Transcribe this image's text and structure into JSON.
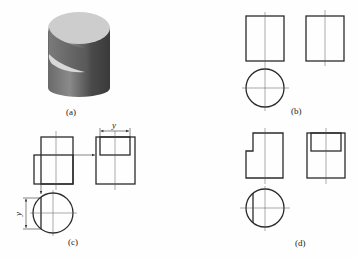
{
  "figure": {
    "panels": [
      {
        "id": "a",
        "label": "(a)",
        "description": "Isometric view of cylinder with a cutout notch"
      },
      {
        "id": "b",
        "label": "(b)",
        "description": "Three views of full cylinder: front, side, top"
      },
      {
        "id": "c",
        "label": "(c)",
        "description": "Construction of views with projection arrows and y dimension"
      },
      {
        "id": "d",
        "label": "(d)",
        "description": "Final three views of notched cylinder"
      }
    ],
    "dimension_label": "y",
    "colors": {
      "line": "#2a2a2a",
      "centerline": "#555555",
      "background": "#fefefe",
      "cylinder_top": "#cfcfcf",
      "cylinder_side_dark": "#555555"
    }
  }
}
